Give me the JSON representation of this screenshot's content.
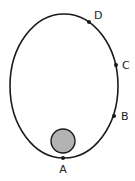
{
  "diagram": {
    "type": "elliptical-orbit",
    "orbit": {
      "cx": 64,
      "cy": 86,
      "rx": 54,
      "ry": 72,
      "stroke": "#1a1a1a"
    },
    "central_body": {
      "cx": 63,
      "cy": 141,
      "r": 12,
      "fill": "#b3b3b3",
      "stroke": "#1a1a1a"
    },
    "points": [
      {
        "id": "A",
        "label": "A",
        "x": 63,
        "y": 158,
        "lx": 63,
        "ly": 173
      },
      {
        "id": "B",
        "label": "B",
        "x": 114,
        "y": 116,
        "lx": 121,
        "ly": 120
      },
      {
        "id": "C",
        "label": "C",
        "x": 116,
        "y": 65,
        "lx": 122,
        "ly": 69
      },
      {
        "id": "D",
        "label": "D",
        "x": 89,
        "y": 22,
        "lx": 94,
        "ly": 19
      }
    ]
  }
}
